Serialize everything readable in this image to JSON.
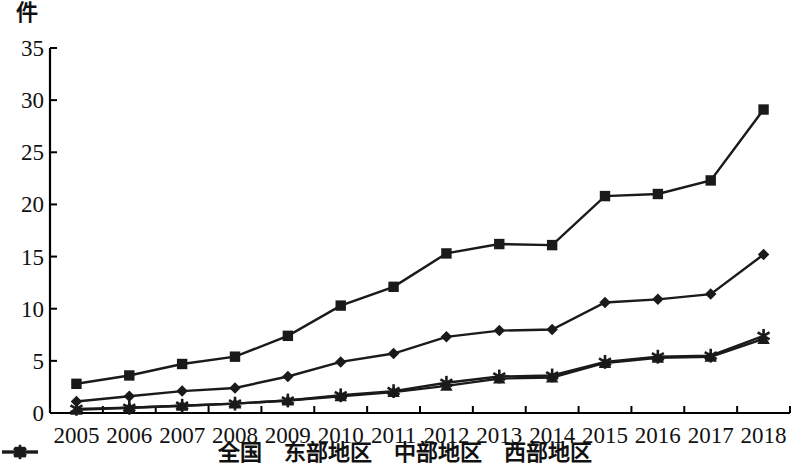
{
  "axis": {
    "y_unit": "件",
    "y_ticks": [
      "0",
      "5",
      "10",
      "15",
      "20",
      "25",
      "30",
      "35"
    ],
    "x_ticks": [
      "2005",
      "2006",
      "2007",
      "2008",
      "2009",
      "2010",
      "2011",
      "2012",
      "2013",
      "2014",
      "2015",
      "2016",
      "2017",
      "2018"
    ]
  },
  "legend": {
    "items": [
      {
        "label": "全国",
        "marker": "diamond"
      },
      {
        "label": "东部地区",
        "marker": "square"
      },
      {
        "label": "中部地区",
        "marker": "triangle"
      },
      {
        "label": "西部地区",
        "marker": "asterisk"
      }
    ]
  },
  "colors": {
    "line": "#1a1a1a",
    "background": "#ffffff",
    "axis": "#000000"
  },
  "chart_data": {
    "type": "line",
    "title": "",
    "xlabel": "",
    "ylabel": "件",
    "ylim": [
      0,
      35
    ],
    "ytick_step": 5,
    "grid": false,
    "legend_position": "bottom",
    "categories": [
      "2005",
      "2006",
      "2007",
      "2008",
      "2009",
      "2010",
      "2011",
      "2012",
      "2013",
      "2014",
      "2015",
      "2016",
      "2017",
      "2018"
    ],
    "series": [
      {
        "name": "全国",
        "marker": "diamond",
        "values": [
          1.1,
          1.6,
          2.1,
          2.4,
          3.5,
          4.9,
          5.7,
          7.3,
          7.9,
          8.0,
          10.6,
          10.9,
          11.4,
          15.2
        ]
      },
      {
        "name": "东部地区",
        "marker": "square",
        "values": [
          2.8,
          3.6,
          4.7,
          5.4,
          7.4,
          10.3,
          12.1,
          15.3,
          16.2,
          16.1,
          20.8,
          21.0,
          22.3,
          29.1
        ]
      },
      {
        "name": "中部地区",
        "marker": "triangle",
        "values": [
          0.3,
          0.5,
          0.7,
          0.9,
          1.2,
          1.6,
          2.0,
          2.6,
          3.3,
          3.4,
          4.8,
          5.3,
          5.4,
          7.1
        ]
      },
      {
        "name": "西部地区",
        "marker": "asterisk",
        "values": [
          0.4,
          0.5,
          0.7,
          0.9,
          1.2,
          1.7,
          2.1,
          2.9,
          3.5,
          3.6,
          4.9,
          5.4,
          5.5,
          7.4
        ]
      }
    ]
  }
}
